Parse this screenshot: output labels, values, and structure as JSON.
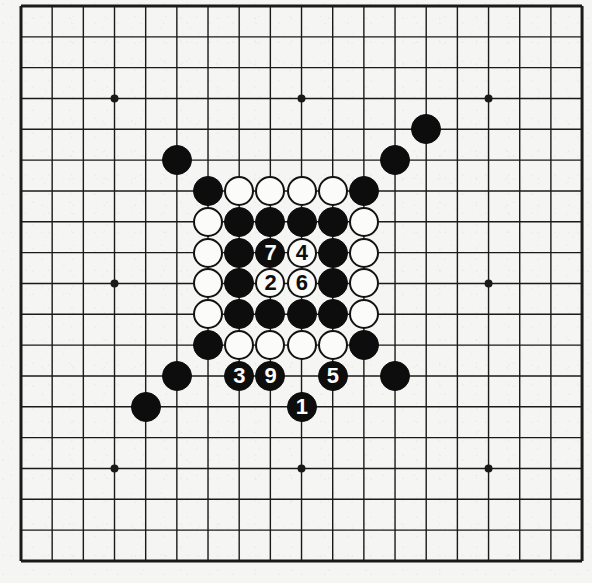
{
  "diagram": {
    "type": "go-board-diagram",
    "board_size": 19,
    "colors": {
      "paper": "#f5f5f3",
      "line": "#1a1a1a",
      "black_stone": "#0d0d0d",
      "white_stone": "#fbfbf9",
      "stone_outline": "#121212",
      "black_label_text": "#fdfdfd",
      "white_label_text": "#0d0d0d"
    },
    "geometry": {
      "origin_x": 21,
      "origin_y": 6,
      "step_x": 31.17,
      "step_y": 30.83,
      "stone_radius": 15,
      "line_width_thin": 1.4,
      "line_width_edge": 3,
      "hoshi_radius": 4
    },
    "hoshi": [
      {
        "col": 3,
        "row": 3
      },
      {
        "col": 9,
        "row": 3
      },
      {
        "col": 15,
        "row": 3
      },
      {
        "col": 3,
        "row": 9
      },
      {
        "col": 15,
        "row": 9
      },
      {
        "col": 3,
        "row": 15
      },
      {
        "col": 9,
        "row": 15
      },
      {
        "col": 15,
        "row": 15
      }
    ],
    "stones": [
      {
        "col": 13,
        "row": 4,
        "color": "black",
        "label": "",
        "name": "stone-black-n13-4"
      },
      {
        "col": 12,
        "row": 5,
        "color": "black",
        "label": "",
        "name": "stone-black-n12-5"
      },
      {
        "col": 5,
        "row": 5,
        "color": "black",
        "label": "",
        "name": "stone-black-n5-5"
      },
      {
        "col": 6,
        "row": 6,
        "color": "black",
        "label": "",
        "name": "stone-black-n6-6"
      },
      {
        "col": 7,
        "row": 6,
        "color": "white",
        "label": "",
        "name": "stone-white-n7-6"
      },
      {
        "col": 8,
        "row": 6,
        "color": "white",
        "label": "",
        "name": "stone-white-n8-6"
      },
      {
        "col": 9,
        "row": 6,
        "color": "white",
        "label": "",
        "name": "stone-white-n9-6"
      },
      {
        "col": 10,
        "row": 6,
        "color": "white",
        "label": "",
        "name": "stone-white-n10-6"
      },
      {
        "col": 11,
        "row": 6,
        "color": "black",
        "label": "",
        "name": "stone-black-n11-6"
      },
      {
        "col": 6,
        "row": 7,
        "color": "white",
        "label": "",
        "name": "stone-white-n6-7"
      },
      {
        "col": 7,
        "row": 7,
        "color": "black",
        "label": "",
        "name": "stone-black-n7-7"
      },
      {
        "col": 8,
        "row": 7,
        "color": "black",
        "label": "",
        "name": "stone-black-n8-7"
      },
      {
        "col": 9,
        "row": 7,
        "color": "black",
        "label": "",
        "name": "stone-black-n9-7"
      },
      {
        "col": 10,
        "row": 7,
        "color": "black",
        "label": "",
        "name": "stone-black-n10-7"
      },
      {
        "col": 11,
        "row": 7,
        "color": "white",
        "label": "",
        "name": "stone-white-n11-7"
      },
      {
        "col": 6,
        "row": 8,
        "color": "white",
        "label": "",
        "name": "stone-white-n6-8"
      },
      {
        "col": 7,
        "row": 8,
        "color": "black",
        "label": "",
        "name": "stone-black-n7-8"
      },
      {
        "col": 8,
        "row": 8,
        "color": "black",
        "label": "7",
        "name": "stone-move-7"
      },
      {
        "col": 9,
        "row": 8,
        "color": "white",
        "label": "4",
        "name": "stone-move-4"
      },
      {
        "col": 10,
        "row": 8,
        "color": "black",
        "label": "",
        "name": "stone-black-n10-8"
      },
      {
        "col": 11,
        "row": 8,
        "color": "white",
        "label": "",
        "name": "stone-white-n11-8"
      },
      {
        "col": 6,
        "row": 9,
        "color": "white",
        "label": "",
        "name": "stone-white-n6-9"
      },
      {
        "col": 7,
        "row": 9,
        "color": "black",
        "label": "",
        "name": "stone-black-n7-9"
      },
      {
        "col": 8,
        "row": 9,
        "color": "white",
        "label": "2",
        "name": "stone-move-2"
      },
      {
        "col": 9,
        "row": 9,
        "color": "white",
        "label": "6",
        "name": "stone-move-6"
      },
      {
        "col": 10,
        "row": 9,
        "color": "black",
        "label": "",
        "name": "stone-black-n10-9"
      },
      {
        "col": 11,
        "row": 9,
        "color": "white",
        "label": "",
        "name": "stone-white-n11-9"
      },
      {
        "col": 6,
        "row": 10,
        "color": "white",
        "label": "",
        "name": "stone-white-n6-10"
      },
      {
        "col": 7,
        "row": 10,
        "color": "black",
        "label": "",
        "name": "stone-black-n7-10"
      },
      {
        "col": 8,
        "row": 10,
        "color": "black",
        "label": "",
        "name": "stone-black-n8-10"
      },
      {
        "col": 9,
        "row": 10,
        "color": "black",
        "label": "",
        "name": "stone-black-n9-10"
      },
      {
        "col": 10,
        "row": 10,
        "color": "black",
        "label": "",
        "name": "stone-black-n10-10"
      },
      {
        "col": 11,
        "row": 10,
        "color": "white",
        "label": "",
        "name": "stone-white-n11-10"
      },
      {
        "col": 6,
        "row": 11,
        "color": "black",
        "label": "",
        "name": "stone-black-n6-11"
      },
      {
        "col": 7,
        "row": 11,
        "color": "white",
        "label": "",
        "name": "stone-white-n7-11"
      },
      {
        "col": 8,
        "row": 11,
        "color": "white",
        "label": "",
        "name": "stone-white-n8-11"
      },
      {
        "col": 9,
        "row": 11,
        "color": "white",
        "label": "",
        "name": "stone-white-n9-11"
      },
      {
        "col": 10,
        "row": 11,
        "color": "white",
        "label": "",
        "name": "stone-white-n10-11"
      },
      {
        "col": 11,
        "row": 11,
        "color": "black",
        "label": "",
        "name": "stone-black-n11-11"
      },
      {
        "col": 5,
        "row": 12,
        "color": "black",
        "label": "",
        "name": "stone-black-n5-12"
      },
      {
        "col": 7,
        "row": 12,
        "color": "black",
        "label": "3",
        "name": "stone-move-3"
      },
      {
        "col": 8,
        "row": 12,
        "color": "black",
        "label": "9",
        "name": "stone-move-9"
      },
      {
        "col": 10,
        "row": 12,
        "color": "black",
        "label": "5",
        "name": "stone-move-5"
      },
      {
        "col": 12,
        "row": 12,
        "color": "black",
        "label": "",
        "name": "stone-black-n12-12"
      },
      {
        "col": 4,
        "row": 13,
        "color": "black",
        "label": "",
        "name": "stone-black-n4-13"
      },
      {
        "col": 9,
        "row": 13,
        "color": "black",
        "label": "1",
        "name": "stone-move-1"
      }
    ],
    "move_sequence": [
      {
        "number": "1",
        "color": "black",
        "col": 9,
        "row": 13
      },
      {
        "number": "2",
        "color": "white",
        "col": 8,
        "row": 9
      },
      {
        "number": "3",
        "color": "black",
        "col": 7,
        "row": 12
      },
      {
        "number": "4",
        "color": "white",
        "col": 9,
        "row": 8
      },
      {
        "number": "5",
        "color": "black",
        "col": 10,
        "row": 12
      },
      {
        "number": "6",
        "color": "white",
        "col": 9,
        "row": 9
      },
      {
        "number": "7",
        "color": "black",
        "col": 8,
        "row": 8
      },
      {
        "number": "9",
        "color": "black",
        "col": 8,
        "row": 12
      }
    ]
  }
}
